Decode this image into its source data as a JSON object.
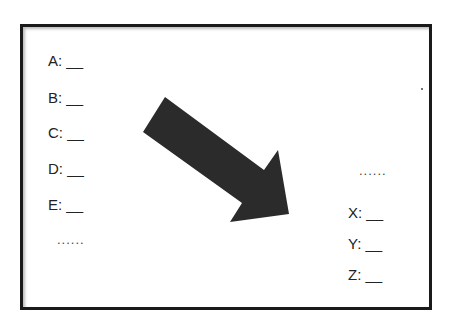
{
  "diagram": {
    "left_labels": [
      {
        "letter": "A",
        "text": "A: __"
      },
      {
        "letter": "B",
        "text": "B: __"
      },
      {
        "letter": "C",
        "text": "C: __"
      },
      {
        "letter": "D",
        "text": "D: __"
      },
      {
        "letter": "E",
        "text": "E: __"
      }
    ],
    "left_ellipsis": "......",
    "right_ellipsis": "......",
    "right_labels": [
      {
        "letter": "X",
        "text": "X: __"
      },
      {
        "letter": "Y",
        "text": "Y: __"
      },
      {
        "letter": "Z",
        "text": "Z: __"
      }
    ],
    "arrow": {
      "direction": "down-right",
      "color": "#2b2b2b"
    },
    "frame_color": "#1a1a1a"
  }
}
